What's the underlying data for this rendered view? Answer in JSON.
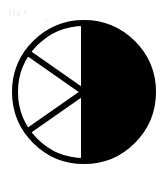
{
  "figure": {
    "name": "sector-circle-glyph",
    "stroke_color": "#000000",
    "fill_color": "#000000",
    "background_color": "#ffffff",
    "stroke_width": 6,
    "center": {
      "x": 84,
      "y": 92
    },
    "radius": 69,
    "bounds": {
      "left": 15,
      "top": 23,
      "right": 153,
      "bottom": 161
    },
    "half_fill": "right",
    "divider_count": 2,
    "divider_angles_deg": [
      145,
      215
    ],
    "sector_span_deg": 60,
    "canvas": {
      "width": 168,
      "height": 180
    }
  },
  "chart_data": {
    "type": "pie",
    "title": "",
    "xlabel": "",
    "ylabel": "",
    "categories": [
      "filled-half",
      "sector-upper-left",
      "sector-middle-left",
      "sector-lower-left"
    ],
    "values": [
      180,
      55,
      70,
      55
    ],
    "unit": "degrees",
    "colors": [
      "#000000",
      "#ffffff",
      "#ffffff",
      "#ffffff"
    ],
    "legend": "none",
    "grid": false,
    "annotations": []
  }
}
